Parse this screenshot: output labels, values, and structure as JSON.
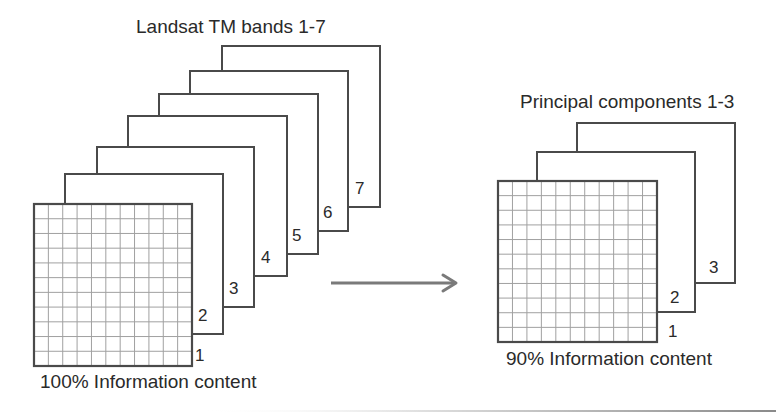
{
  "left_stack": {
    "title": "Landsat TM bands 1-7",
    "caption": "100% Information content",
    "grid": {
      "columns": 11,
      "rows": 11
    },
    "bands": [
      {
        "label": "1",
        "x1": 34,
        "y1": 204,
        "x2": 192,
        "y2": 366,
        "label_x": 195,
        "label_y": 361
      },
      {
        "label": "2",
        "x1": 65,
        "y1": 174,
        "x2": 223,
        "y2": 334,
        "label_x": 198,
        "label_y": 321
      },
      {
        "label": "3",
        "x1": 97,
        "y1": 147,
        "x2": 254,
        "y2": 307,
        "label_x": 229,
        "label_y": 294
      },
      {
        "label": "4",
        "x1": 128,
        "y1": 116,
        "x2": 287,
        "y2": 276,
        "label_x": 261,
        "label_y": 263
      },
      {
        "label": "5",
        "x1": 159,
        "y1": 94,
        "x2": 318,
        "y2": 254,
        "label_x": 292,
        "label_y": 241
      },
      {
        "label": "6",
        "x1": 190,
        "y1": 71,
        "x2": 348,
        "y2": 231,
        "label_x": 323,
        "label_y": 218
      },
      {
        "label": "7",
        "x1": 222,
        "y1": 46,
        "x2": 380,
        "y2": 207,
        "label_x": 355,
        "label_y": 194
      }
    ]
  },
  "right_stack": {
    "title": "Principal components 1-3",
    "caption": "90% Information content",
    "grid": {
      "columns": 11,
      "rows": 11
    },
    "components": [
      {
        "label": "1",
        "x1": 498,
        "y1": 181,
        "x2": 657,
        "y2": 342,
        "label_x": 668,
        "label_y": 337
      },
      {
        "label": "2",
        "x1": 537,
        "y1": 152,
        "x2": 695,
        "y2": 312,
        "label_x": 670,
        "label_y": 303
      },
      {
        "label": "3",
        "x1": 577,
        "y1": 123,
        "x2": 735,
        "y2": 283,
        "label_x": 709,
        "label_y": 273
      }
    ]
  },
  "arrow": {
    "x1": 331,
    "y1": 283,
    "x2": 457,
    "y2": 283,
    "color": "#7a7a7a"
  },
  "colors": {
    "frame_stroke": "#4a4a4a",
    "grid_stroke": "#a0a0a0",
    "text": "#2a2a2a",
    "background": "#ffffff"
  }
}
